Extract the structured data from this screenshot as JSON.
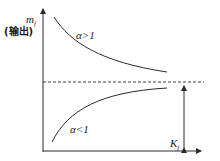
{
  "diagram": {
    "y_axis_label": {
      "symbol": "m",
      "subscript": "f",
      "note": "(输出)"
    },
    "x_marker_label": {
      "symbol": "K",
      "subscript": "f"
    },
    "curves": [
      {
        "label": "α>1",
        "description": "decreasing curve approaching asymptote from above"
      },
      {
        "label": "α<1",
        "description": "increasing curve approaching asymptote from below"
      }
    ],
    "asymptote": "dashed horizontal line",
    "colors": {
      "line": "#2a2a2a",
      "text": "#1a1a1a",
      "background": "#ffffff"
    }
  }
}
